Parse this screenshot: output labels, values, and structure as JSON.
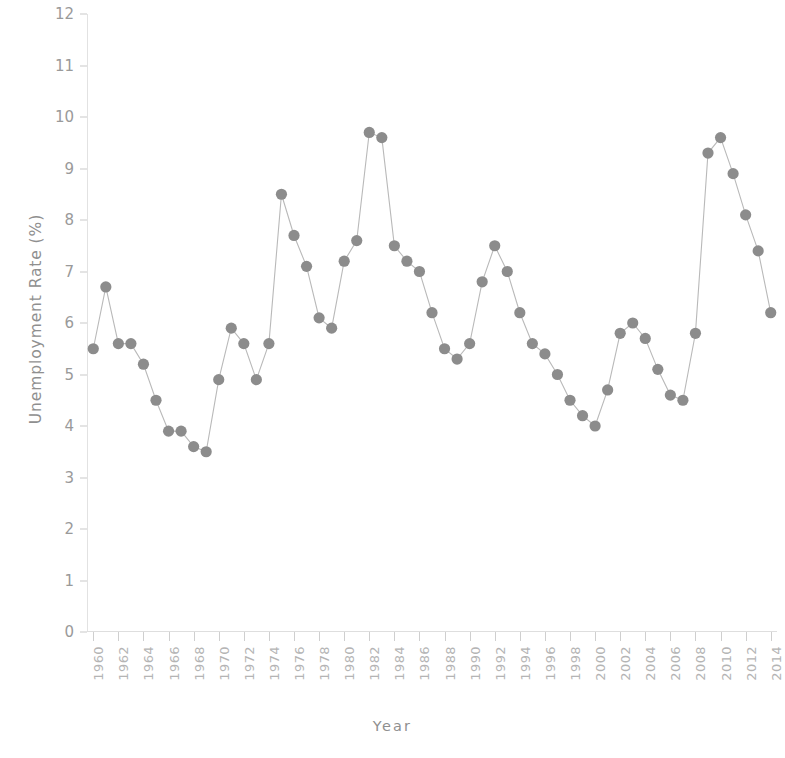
{
  "chart_data": {
    "type": "line",
    "title": "",
    "xlabel": "Year",
    "ylabel": "Unemployment Rate (%)",
    "ylim": [
      0,
      12
    ],
    "ytick_labels": [
      "0",
      "1",
      "2",
      "3",
      "4",
      "5",
      "6",
      "7",
      "8",
      "9",
      "10",
      "11",
      "12"
    ],
    "ytick_values": [
      0,
      1,
      2,
      3,
      4,
      5,
      6,
      7,
      8,
      9,
      10,
      11,
      12
    ],
    "xlim": [
      1959.5,
      2014.5
    ],
    "xtick_labels": [
      "1960",
      "1962",
      "1964",
      "1966",
      "1968",
      "1970",
      "1972",
      "1974",
      "1976",
      "1978",
      "1980",
      "1982",
      "1984",
      "1986",
      "1988",
      "1990",
      "1992",
      "1994",
      "1996",
      "1998",
      "2000",
      "2002",
      "2004",
      "2006",
      "2008",
      "2010",
      "2012",
      "2014"
    ],
    "xtick_values": [
      1960,
      1962,
      1964,
      1966,
      1968,
      1970,
      1972,
      1974,
      1976,
      1978,
      1980,
      1982,
      1984,
      1986,
      1988,
      1990,
      1992,
      1994,
      1996,
      1998,
      2000,
      2002,
      2004,
      2006,
      2008,
      2010,
      2012,
      2014
    ],
    "grid": false,
    "legend": "none",
    "marker": "circle",
    "series_color": "#8c8c8c",
    "line_color": "#b9b9b9",
    "x": [
      1960,
      1961,
      1962,
      1963,
      1964,
      1965,
      1966,
      1967,
      1968,
      1969,
      1970,
      1971,
      1972,
      1973,
      1974,
      1975,
      1976,
      1977,
      1978,
      1979,
      1980,
      1981,
      1982,
      1983,
      1984,
      1985,
      1986,
      1987,
      1988,
      1989,
      1990,
      1991,
      1992,
      1993,
      1994,
      1995,
      1996,
      1997,
      1998,
      1999,
      2000,
      2001,
      2002,
      2003,
      2004,
      2005,
      2006,
      2007,
      2008,
      2009,
      2010,
      2011,
      2012,
      2013,
      2014
    ],
    "values": [
      5.5,
      6.7,
      5.6,
      5.6,
      5.2,
      4.5,
      3.9,
      3.9,
      3.6,
      3.5,
      4.9,
      5.9,
      5.6,
      4.9,
      5.6,
      8.5,
      7.7,
      7.1,
      6.1,
      5.9,
      7.2,
      7.6,
      9.7,
      9.6,
      7.5,
      7.2,
      7.0,
      6.2,
      5.5,
      5.3,
      5.6,
      6.8,
      7.5,
      7.0,
      6.2,
      5.6,
      5.4,
      5.0,
      4.5,
      4.2,
      4.0,
      4.7,
      5.8,
      6.0,
      5.7,
      5.1,
      4.6,
      4.5,
      5.8,
      9.3,
      9.6,
      8.9,
      8.1,
      7.4,
      6.2
    ]
  }
}
